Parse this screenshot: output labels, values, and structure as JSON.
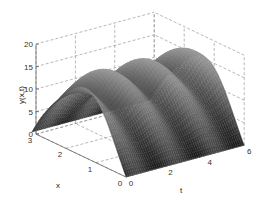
{
  "chart_data": {
    "type": "surface3d",
    "title": "",
    "xlabel": "x",
    "ylabel": "t",
    "zlabel": "y(x,t)",
    "x_range": [
      0,
      3.14159
    ],
    "t_range": [
      0,
      6
    ],
    "z_range": [
      0,
      20
    ],
    "x_ticks": [
      "0",
      "1",
      "2",
      "3"
    ],
    "t_ticks": [
      "0",
      "2",
      "4",
      "6"
    ],
    "z_ticks": [
      "0",
      "5",
      "10",
      "15",
      "20"
    ],
    "grid": true,
    "colormap": "gray",
    "surface_description": "Arch-shaped surface in x (sin-like, zero at x=0 and x=pi) with peak about 17, modulated by periodic ripples along t",
    "surface_model": {
      "amplitude": 15,
      "ripple_amplitude": 2,
      "ripple_frequency_t": 6.2832,
      "x_samples": 40,
      "t_samples": 60
    }
  }
}
